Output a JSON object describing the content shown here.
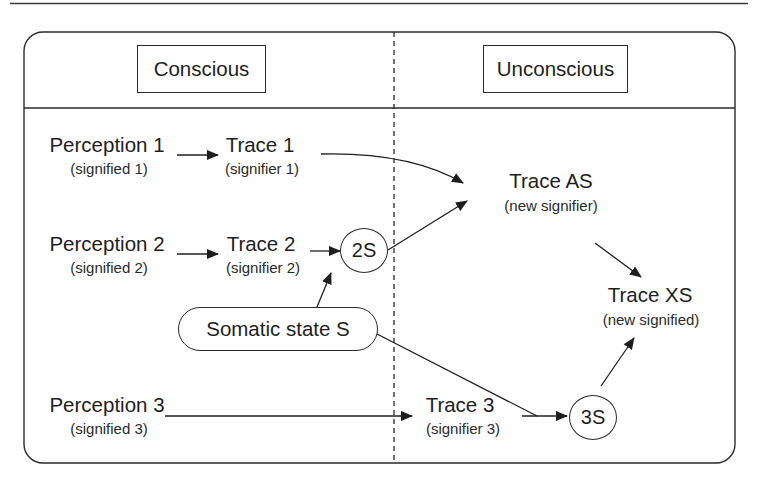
{
  "columns": {
    "left_header": "Conscious",
    "right_header": "Unconscious"
  },
  "nodes": {
    "perception1": {
      "title": "Perception 1",
      "sub": "(signified 1)"
    },
    "trace1": {
      "title": "Trace 1",
      "sub": "(signifier 1)"
    },
    "perception2": {
      "title": "Perception 2",
      "sub": "(signified 2)"
    },
    "trace2": {
      "title": "Trace 2",
      "sub": "(signifier 2)"
    },
    "circle2s": {
      "label": "2S"
    },
    "somatic": {
      "label": "Somatic state S"
    },
    "perception3": {
      "title": "Perception 3",
      "sub": "(signified 3)"
    },
    "trace3": {
      "title": "Trace 3",
      "sub": "(signifier 3)"
    },
    "circle3s": {
      "label": "3S"
    },
    "traceAS": {
      "title": "Trace AS",
      "sub": "(new signifier)"
    },
    "traceXS": {
      "title": "Trace XS",
      "sub": "(new signified)"
    }
  },
  "edges": [
    {
      "from": "Perception 1",
      "to": "Trace 1"
    },
    {
      "from": "Trace 1",
      "to": "Trace AS"
    },
    {
      "from": "Perception 2",
      "to": "Trace 2"
    },
    {
      "from": "Trace 2",
      "to": "2S"
    },
    {
      "from": "Somatic state S",
      "to": "2S"
    },
    {
      "from": "2S",
      "to": "Trace AS"
    },
    {
      "from": "Trace AS",
      "to": "Trace XS"
    },
    {
      "from": "Perception 3",
      "to": "Trace 3"
    },
    {
      "from": "Trace 3",
      "to": "3S"
    },
    {
      "from": "Somatic state S",
      "to": "3S"
    },
    {
      "from": "3S",
      "to": "Trace XS"
    }
  ],
  "colors": {
    "stroke": "#2a2a2a",
    "text": "#1e1e1e",
    "background": "#ffffff"
  }
}
